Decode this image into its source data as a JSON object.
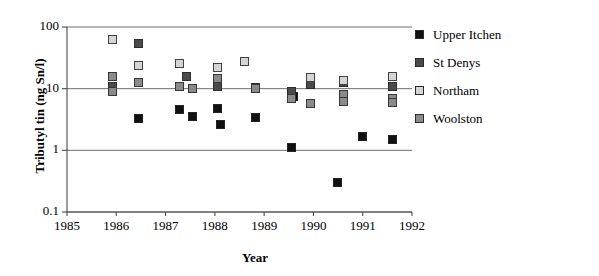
{
  "chart_data": {
    "type": "scatter",
    "title": "",
    "xlabel": "Year",
    "ylabel": "Tributyl tin (ng Sn/l)",
    "yscale": "log",
    "ylim": [
      0.1,
      100
    ],
    "xlim": [
      1985,
      1992
    ],
    "yticks": [
      "0.1",
      "1",
      "10",
      "100"
    ],
    "ytick_values": [
      0.1,
      1,
      10,
      100
    ],
    "xticks": [
      "1985",
      "1986",
      "1987",
      "1988",
      "1989",
      "1990",
      "1991",
      "1992"
    ],
    "xtick_values": [
      1985,
      1986,
      1987,
      1988,
      1989,
      1990,
      1991,
      1992
    ],
    "grid": true,
    "legend_position": "right",
    "colors": {
      "upper_itchen": "#111111",
      "st_denys": "#4a4a4a",
      "northam": "#d5d5d5",
      "woolston": "#8a8a8a"
    },
    "series": [
      {
        "name": "Upper Itchen",
        "color": "#111111",
        "points": [
          [
            1985.92,
            10.0
          ],
          [
            1986.45,
            3.3
          ],
          [
            1987.28,
            4.6
          ],
          [
            1987.55,
            3.6
          ],
          [
            1988.05,
            4.7
          ],
          [
            1988.12,
            2.6
          ],
          [
            1988.82,
            3.4
          ],
          [
            1989.55,
            1.1
          ],
          [
            1989.6,
            7.5
          ],
          [
            1990.48,
            0.3
          ],
          [
            1991.0,
            1.7
          ],
          [
            1991.6,
            1.5
          ]
        ]
      },
      {
        "name": "St Denys",
        "color": "#4a4a4a",
        "points": [
          [
            1985.92,
            11.0
          ],
          [
            1986.45,
            55.0
          ],
          [
            1987.42,
            16.0
          ],
          [
            1988.05,
            11.0
          ],
          [
            1988.82,
            10.5
          ],
          [
            1989.55,
            9.0
          ],
          [
            1989.95,
            11.5
          ],
          [
            1990.62,
            12.5
          ],
          [
            1991.6,
            11.0
          ]
        ]
      },
      {
        "name": "Northam",
        "color": "#d5d5d5",
        "points": [
          [
            1985.92,
            62.0
          ],
          [
            1986.45,
            24.0
          ],
          [
            1987.28,
            26.0
          ],
          [
            1988.05,
            22.0
          ],
          [
            1988.6,
            28.0
          ],
          [
            1989.95,
            15.0
          ],
          [
            1990.62,
            13.5
          ],
          [
            1991.6,
            15.5
          ]
        ]
      },
      {
        "name": "Woolston",
        "color": "#8a8a8a",
        "points": [
          [
            1985.92,
            16.0
          ],
          [
            1985.92,
            9.0
          ],
          [
            1986.45,
            12.5
          ],
          [
            1987.28,
            11.0
          ],
          [
            1987.55,
            10.0
          ],
          [
            1988.05,
            14.5
          ],
          [
            1988.82,
            10.0
          ],
          [
            1989.55,
            7.0
          ],
          [
            1989.95,
            5.8
          ],
          [
            1990.62,
            8.0
          ],
          [
            1990.62,
            6.3
          ],
          [
            1991.6,
            7.0
          ],
          [
            1991.6,
            5.9
          ]
        ]
      }
    ]
  },
  "axes": {
    "y_title": "Tributyl tin (ng Sn/l)",
    "x_title": "Year"
  },
  "legend": {
    "items": [
      {
        "label": "Upper Itchen",
        "color": "#111111",
        "swatch": "legend-swatch-upper-itchen"
      },
      {
        "label": "St Denys",
        "color": "#4a4a4a",
        "swatch": "legend-swatch-st-denys"
      },
      {
        "label": "Northam",
        "color": "#d5d5d5",
        "swatch": "legend-swatch-northam"
      },
      {
        "label": "Woolston",
        "color": "#8a8a8a",
        "swatch": "legend-swatch-woolston"
      }
    ]
  }
}
